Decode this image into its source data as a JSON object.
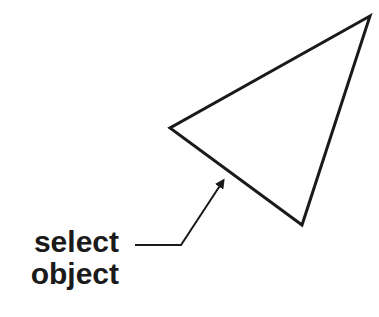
{
  "diagram": {
    "label": {
      "line1": "select",
      "line2": "object"
    },
    "shape": {
      "type": "triangle",
      "vertices": [
        [
          370,
          16
        ],
        [
          170,
          128
        ],
        [
          302,
          225
        ]
      ],
      "stroke": "#1a1a1a",
      "fill": "none"
    },
    "leader": {
      "points": [
        [
          135,
          245
        ],
        [
          181,
          245
        ],
        [
          222,
          182
        ]
      ],
      "arrow_tip": [
        227,
        174
      ]
    }
  }
}
